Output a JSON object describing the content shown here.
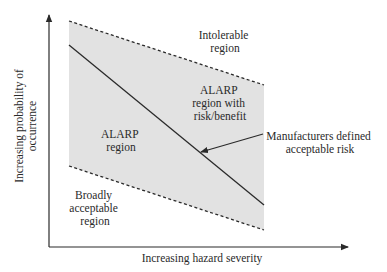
{
  "diagram": {
    "type": "risk-region-diagram",
    "x_axis_label": "Increasing hazard severity",
    "y_axis_label_line1": "Increasing probability of",
    "y_axis_label_line2": "occurrence",
    "regions": {
      "intolerable": {
        "line1": "Intolerable",
        "line2": "region"
      },
      "alarp_left": {
        "line1": "ALARP",
        "line2": "region"
      },
      "alarp_right": {
        "line1": "ALARP",
        "line2": "region with",
        "line3": "risk/benefit"
      },
      "broadly_acceptable": {
        "line1": "Broadly",
        "line2": "acceptable",
        "line3": "region"
      }
    },
    "annotation": {
      "line1": "Manufacturers defined",
      "line2": "acceptable risk"
    },
    "colors": {
      "shade": "#e2e2e2",
      "line": "#2a2a2a",
      "background": "#ffffff"
    }
  }
}
